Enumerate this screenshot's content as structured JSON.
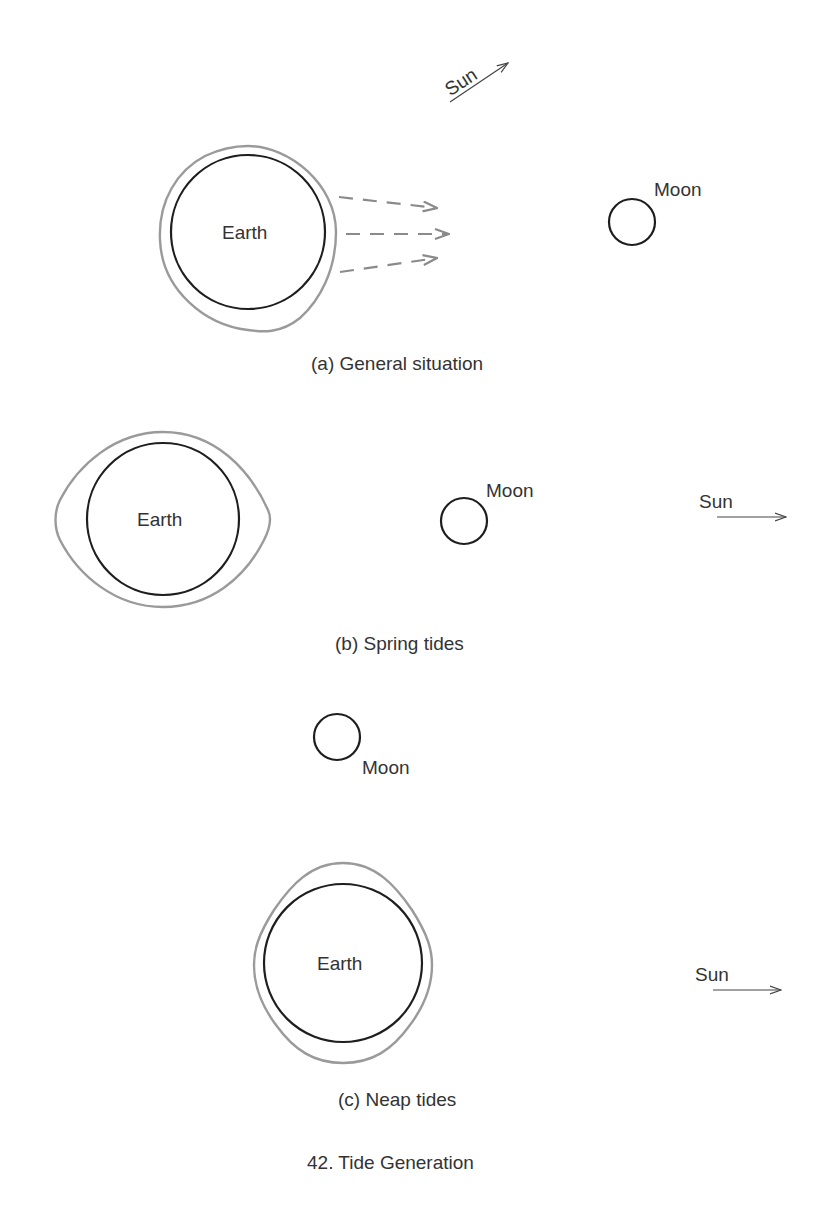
{
  "figure": {
    "title": "42. Tide Generation",
    "colors": {
      "body_outline": "#1e1e1e",
      "tide_bulge": "#9a9a9a",
      "force_arrows": "#8a8a8a",
      "text": "#333333"
    },
    "panels": [
      {
        "id": "a",
        "caption": "(a) General situation",
        "earth_label": "Earth",
        "moon_label": "Moon",
        "sun_label": "Sun",
        "sun_direction": "upper-right (diagonal)",
        "force_arrows": 3
      },
      {
        "id": "b",
        "caption": "(b) Spring tides",
        "earth_label": "Earth",
        "moon_label": "Moon",
        "sun_label": "Sun",
        "sun_direction": "right"
      },
      {
        "id": "c",
        "caption": "(c) Neap tides",
        "earth_label": "Earth",
        "moon_label": "Moon",
        "sun_label": "Sun",
        "sun_direction": "right"
      }
    ]
  }
}
